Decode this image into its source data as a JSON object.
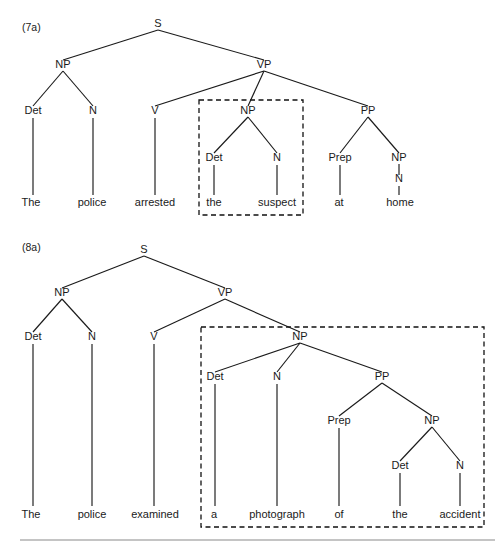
{
  "figure": {
    "background_color": "#ffffff",
    "line_color": "#1a1a1a",
    "box_color": "#111111",
    "rule_color": "#8a8a8a",
    "width": 503,
    "height": 552
  },
  "trees": [
    {
      "id": "tree-7a",
      "example_label": "(7a)",
      "example_label_pos": {
        "x": 22,
        "y": 31
      },
      "sentence": "The police arrested the suspect at home",
      "focus_box": {
        "x": 199,
        "y": 100,
        "width": 104,
        "height": 115
      },
      "focus_constituent": "NP",
      "focus_text": "the suspect",
      "nodes": [
        {
          "name": "s",
          "label": "S",
          "x": 158,
          "y": 27
        },
        {
          "name": "np-subj",
          "label": "NP",
          "x": 63,
          "y": 68
        },
        {
          "name": "vp",
          "label": "VP",
          "x": 264,
          "y": 68
        },
        {
          "name": "det-1",
          "label": "Det",
          "x": 33,
          "y": 114
        },
        {
          "name": "n-1",
          "label": "N",
          "x": 93,
          "y": 114
        },
        {
          "name": "v",
          "label": "V",
          "x": 155,
          "y": 114
        },
        {
          "name": "np-obj",
          "label": "NP",
          "x": 248,
          "y": 114
        },
        {
          "name": "pp",
          "label": "PP",
          "x": 368,
          "y": 114
        },
        {
          "name": "det-2",
          "label": "Det",
          "x": 214,
          "y": 161
        },
        {
          "name": "n-2",
          "label": "N",
          "x": 277,
          "y": 161
        },
        {
          "name": "prep",
          "label": "Prep",
          "x": 340,
          "y": 161
        },
        {
          "name": "np-pp",
          "label": "NP",
          "x": 399,
          "y": 161
        },
        {
          "name": "n-3",
          "label": "N",
          "x": 399,
          "y": 182
        }
      ],
      "edges": [
        {
          "x1": 158,
          "y1": 30,
          "x2": 63,
          "y2": 60
        },
        {
          "x1": 158,
          "y1": 30,
          "x2": 264,
          "y2": 60
        },
        {
          "x1": 63,
          "y1": 71,
          "x2": 33,
          "y2": 106
        },
        {
          "x1": 63,
          "y1": 71,
          "x2": 93,
          "y2": 106
        },
        {
          "x1": 264,
          "y1": 71,
          "x2": 155,
          "y2": 106
        },
        {
          "x1": 264,
          "y1": 71,
          "x2": 248,
          "y2": 106
        },
        {
          "x1": 264,
          "y1": 71,
          "x2": 368,
          "y2": 106
        },
        {
          "x1": 248,
          "y1": 117,
          "x2": 214,
          "y2": 153
        },
        {
          "x1": 248,
          "y1": 117,
          "x2": 277,
          "y2": 153
        },
        {
          "x1": 368,
          "y1": 117,
          "x2": 340,
          "y2": 153
        },
        {
          "x1": 368,
          "y1": 117,
          "x2": 399,
          "y2": 153
        },
        {
          "x1": 399,
          "y1": 164,
          "x2": 399,
          "y2": 175
        },
        {
          "x1": 33,
          "y1": 118,
          "x2": 33,
          "y2": 195
        },
        {
          "x1": 93,
          "y1": 118,
          "x2": 93,
          "y2": 195
        },
        {
          "x1": 155,
          "y1": 118,
          "x2": 155,
          "y2": 195
        },
        {
          "x1": 214,
          "y1": 165,
          "x2": 214,
          "y2": 195
        },
        {
          "x1": 277,
          "y1": 165,
          "x2": 277,
          "y2": 195
        },
        {
          "x1": 340,
          "y1": 165,
          "x2": 340,
          "y2": 195
        },
        {
          "x1": 399,
          "y1": 186,
          "x2": 399,
          "y2": 195
        }
      ],
      "leaves": [
        {
          "name": "leaf-the-1",
          "label": "The",
          "x": 31,
          "y": 206
        },
        {
          "name": "leaf-police-1",
          "label": "police",
          "x": 92,
          "y": 206
        },
        {
          "name": "leaf-arrested",
          "label": "arrested",
          "x": 155,
          "y": 206
        },
        {
          "name": "leaf-the-2",
          "label": "the",
          "x": 214,
          "y": 206
        },
        {
          "name": "leaf-suspect",
          "label": "suspect",
          "x": 277,
          "y": 206
        },
        {
          "name": "leaf-at",
          "label": "at",
          "x": 339,
          "y": 206
        },
        {
          "name": "leaf-home",
          "label": "home",
          "x": 400,
          "y": 206
        }
      ]
    },
    {
      "id": "tree-8a",
      "example_label": "(8a)",
      "example_label_pos": {
        "x": 22,
        "y": 251
      },
      "sentence": "The police examined a photograph of the accident",
      "focus_box": {
        "x": 201,
        "y": 327,
        "width": 283,
        "height": 200
      },
      "focus_constituent": "NP",
      "focus_text": "a photograph of the accident",
      "nodes": [
        {
          "name": "s",
          "label": "S",
          "x": 144,
          "y": 253
        },
        {
          "name": "np-subj",
          "label": "NP",
          "x": 62,
          "y": 296
        },
        {
          "name": "vp",
          "label": "VP",
          "x": 225,
          "y": 296
        },
        {
          "name": "det-1",
          "label": "Det",
          "x": 33,
          "y": 340
        },
        {
          "name": "n-1",
          "label": "N",
          "x": 92,
          "y": 340
        },
        {
          "name": "v",
          "label": "V",
          "x": 154,
          "y": 340
        },
        {
          "name": "np-obj",
          "label": "NP",
          "x": 300,
          "y": 340
        },
        {
          "name": "det-2",
          "label": "Det",
          "x": 215,
          "y": 380
        },
        {
          "name": "n-2",
          "label": "N",
          "x": 277,
          "y": 380
        },
        {
          "name": "pp",
          "label": "PP",
          "x": 382,
          "y": 380
        },
        {
          "name": "prep",
          "label": "Prep",
          "x": 339,
          "y": 424
        },
        {
          "name": "np-pp",
          "label": "NP",
          "x": 432,
          "y": 424
        },
        {
          "name": "det-3",
          "label": "Det",
          "x": 400,
          "y": 469
        },
        {
          "name": "n-3",
          "label": "N",
          "x": 460,
          "y": 469
        }
      ],
      "edges": [
        {
          "x1": 144,
          "y1": 256,
          "x2": 62,
          "y2": 288
        },
        {
          "x1": 144,
          "y1": 256,
          "x2": 225,
          "y2": 288
        },
        {
          "x1": 62,
          "y1": 299,
          "x2": 33,
          "y2": 332
        },
        {
          "x1": 62,
          "y1": 299,
          "x2": 92,
          "y2": 332
        },
        {
          "x1": 225,
          "y1": 299,
          "x2": 154,
          "y2": 332
        },
        {
          "x1": 225,
          "y1": 299,
          "x2": 300,
          "y2": 332
        },
        {
          "x1": 300,
          "y1": 343,
          "x2": 215,
          "y2": 372
        },
        {
          "x1": 300,
          "y1": 343,
          "x2": 277,
          "y2": 372
        },
        {
          "x1": 300,
          "y1": 343,
          "x2": 382,
          "y2": 372
        },
        {
          "x1": 382,
          "y1": 383,
          "x2": 339,
          "y2": 416
        },
        {
          "x1": 382,
          "y1": 383,
          "x2": 432,
          "y2": 416
        },
        {
          "x1": 432,
          "y1": 427,
          "x2": 400,
          "y2": 461
        },
        {
          "x1": 432,
          "y1": 427,
          "x2": 460,
          "y2": 461
        },
        {
          "x1": 33,
          "y1": 344,
          "x2": 33,
          "y2": 506
        },
        {
          "x1": 92,
          "y1": 344,
          "x2": 92,
          "y2": 506
        },
        {
          "x1": 154,
          "y1": 344,
          "x2": 154,
          "y2": 506
        },
        {
          "x1": 215,
          "y1": 384,
          "x2": 215,
          "y2": 506
        },
        {
          "x1": 277,
          "y1": 384,
          "x2": 277,
          "y2": 506
        },
        {
          "x1": 339,
          "y1": 428,
          "x2": 339,
          "y2": 506
        },
        {
          "x1": 400,
          "y1": 473,
          "x2": 400,
          "y2": 506
        },
        {
          "x1": 460,
          "y1": 473,
          "x2": 460,
          "y2": 506
        }
      ],
      "leaves": [
        {
          "name": "leaf-the-1",
          "label": "The",
          "x": 31,
          "y": 518
        },
        {
          "name": "leaf-police-2",
          "label": "police",
          "x": 92,
          "y": 518
        },
        {
          "name": "leaf-examined",
          "label": "examined",
          "x": 155,
          "y": 518
        },
        {
          "name": "leaf-a",
          "label": "a",
          "x": 214,
          "y": 518
        },
        {
          "name": "leaf-photograph",
          "label": "photograph",
          "x": 277,
          "y": 518
        },
        {
          "name": "leaf-of",
          "label": "of",
          "x": 339,
          "y": 518
        },
        {
          "name": "leaf-the-2",
          "label": "the",
          "x": 400,
          "y": 518
        },
        {
          "name": "leaf-accident",
          "label": "accident",
          "x": 460,
          "y": 518
        }
      ]
    }
  ],
  "footer_rule": {
    "x1": 20,
    "y1": 540,
    "x2": 495,
    "y2": 540
  }
}
